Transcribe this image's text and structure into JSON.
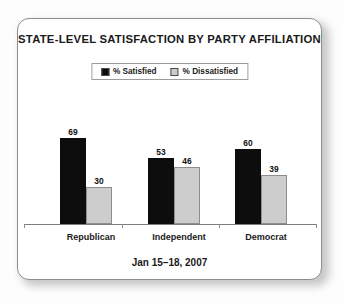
{
  "chart_data": {
    "type": "bar",
    "title": "STATE-LEVEL SATISFACTION BY PARTY AFFILIATION",
    "footnote": "Jan 15–18, 2007",
    "xlabel": "",
    "ylabel": "",
    "ylim": [
      0,
      100
    ],
    "grid": false,
    "legend_position": "top-center",
    "categories": [
      "Republican",
      "Independent",
      "Democrat"
    ],
    "series": [
      {
        "name": "% Satisfied",
        "color": "#0d0d0d",
        "values": [
          69,
          53,
          60
        ]
      },
      {
        "name": "% Dissatisfied",
        "color": "#cdcdcd",
        "values": [
          30,
          46,
          39
        ]
      }
    ]
  },
  "card": {
    "border_color": "#8d8d8d",
    "background": "#ffffff"
  }
}
